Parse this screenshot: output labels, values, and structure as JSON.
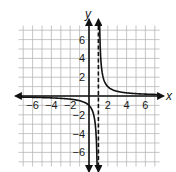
{
  "chart_data": {
    "type": "line",
    "title": "",
    "xlabel": "x",
    "ylabel": "y",
    "xlim": [
      -7.5,
      7.5
    ],
    "ylim": [
      -7.5,
      7.5
    ],
    "grid": true,
    "x_ticks": [
      -6,
      -4,
      -2,
      2,
      4,
      6
    ],
    "y_ticks": [
      6,
      4,
      2,
      -2,
      -4,
      -6
    ],
    "x_tick_labels": [
      "−6",
      "−4",
      "−2",
      "2",
      "4",
      "6"
    ],
    "y_tick_labels": [
      "6",
      "4",
      "2",
      "−2",
      "−4",
      "−6"
    ],
    "asymptotes": {
      "vertical": 1,
      "horizontal": 0
    },
    "function": "y = 1/(x - 1)",
    "series": [
      {
        "name": "left branch",
        "x": [
          -7.5,
          -6,
          -4,
          -2,
          -1,
          0,
          0.5,
          0.8,
          0.87
        ],
        "y": [
          -0.12,
          -0.14,
          -0.2,
          -0.33,
          -0.5,
          -1,
          -2,
          -5,
          -7.5
        ]
      },
      {
        "name": "right branch",
        "x": [
          1.13,
          1.2,
          1.5,
          2,
          3,
          4,
          6,
          7.5
        ],
        "y": [
          7.5,
          5,
          2,
          1,
          0.5,
          0.33,
          0.2,
          0.15
        ]
      }
    ]
  },
  "labels": {
    "x_axis": "x",
    "y_axis": "y"
  }
}
